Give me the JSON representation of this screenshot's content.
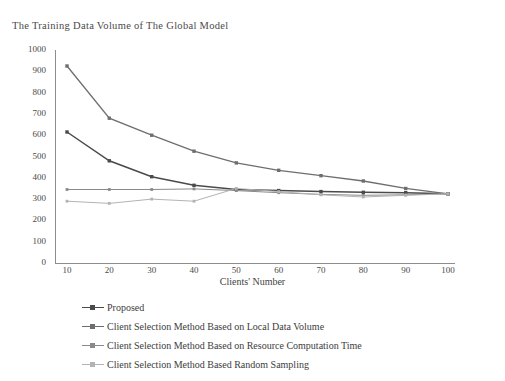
{
  "chart_data": {
    "type": "line",
    "title": "The Training Data Volume of The Global Model",
    "xlabel": "Clients' Number",
    "ylabel": "",
    "x": [
      10,
      20,
      30,
      40,
      50,
      60,
      70,
      80,
      90,
      100
    ],
    "xlim": [
      0,
      100
    ],
    "ylim": [
      0,
      1000
    ],
    "xticks": [
      "10",
      "20",
      "30",
      "40",
      "50",
      "60",
      "70",
      "80",
      "90",
      "100"
    ],
    "yticks": [
      "0",
      "100",
      "200",
      "300",
      "400",
      "500",
      "600",
      "700",
      "800",
      "900",
      "1000"
    ],
    "grid": false,
    "legend_position": "below",
    "series": [
      {
        "name": "Proposed",
        "color": "#4a4a4a",
        "values": [
          615,
          480,
          405,
          365,
          345,
          340,
          335,
          332,
          330,
          325
        ]
      },
      {
        "name": "Client Selection Method Based on Local Data Volume",
        "color": "#6e6e6e",
        "values": [
          925,
          680,
          600,
          525,
          470,
          435,
          410,
          385,
          350,
          325
        ]
      },
      {
        "name": "Client Selection Method Based on Resource Computation Time",
        "color": "#8a8a8a",
        "values": [
          345,
          345,
          345,
          348,
          340,
          330,
          322,
          318,
          320,
          325
        ]
      },
      {
        "name": "Client Selection Method Based Random Sampling",
        "color": "#b3b3b3",
        "values": [
          290,
          280,
          300,
          290,
          350,
          335,
          320,
          310,
          318,
          325
        ]
      }
    ]
  },
  "axes": {
    "x_label": "Clients' Number",
    "x_ticks": [
      "10",
      "20",
      "30",
      "40",
      "50",
      "60",
      "70",
      "80",
      "90",
      "100"
    ],
    "y_ticks": [
      "1000",
      "900",
      "800",
      "700",
      "600",
      "500",
      "400",
      "300",
      "200",
      "100",
      "0"
    ]
  },
  "legend": {
    "items": [
      {
        "label": "Proposed",
        "color": "#4a4a4a"
      },
      {
        "label": "Client Selection Method Based on Local Data Volume",
        "color": "#6e6e6e"
      },
      {
        "label": "Client Selection Method Based on Resource Computation Time",
        "color": "#8a8a8a"
      },
      {
        "label": "Client Selection Method Based Random Sampling",
        "color": "#b3b3b3"
      }
    ]
  }
}
